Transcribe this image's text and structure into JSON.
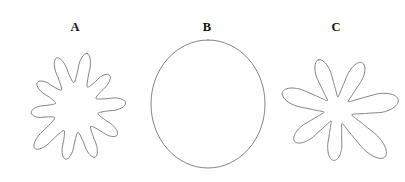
{
  "figure": {
    "background_color": "#ffffff",
    "width": 405,
    "height": 182,
    "stroke_color": "#6e6e72",
    "label_color": "#101010",
    "caption": ""
  },
  "panels": [
    {
      "label": "A",
      "label_x": 75,
      "label_y": 31,
      "shape_name": "lobed-blob-many-lobes",
      "description": "irregular closed outline with ten rounded finger-like lobes radiating from a central body",
      "center_x": 76,
      "center_y": 108,
      "lobe_count": 10,
      "mean_radius": 38,
      "lobe_amplitude": 14,
      "bounds": {
        "x": 22,
        "y": 45,
        "width": 108,
        "height": 125
      }
    },
    {
      "label": "B",
      "label_x": 207,
      "label_y": 31,
      "shape_name": "smooth-ellipse",
      "description": "smooth convex closed outline, near-circular ellipse with no lobes",
      "center_x": 208,
      "center_y": 104,
      "lobe_count": 0,
      "radius_x": 57,
      "radius_y": 64,
      "bounds": {
        "x": 151,
        "y": 40,
        "width": 114,
        "height": 128
      }
    },
    {
      "label": "C",
      "label_x": 336,
      "label_y": 31,
      "shape_name": "lobed-blob-few-long-lobes",
      "description": "irregular closed outline with seven long narrow finger-like lobes of uneven length",
      "center_x": 337,
      "center_y": 110,
      "lobe_count": 7,
      "mean_radius": 36,
      "lobe_amplitude": 22,
      "bounds": {
        "x": 283,
        "y": 44,
        "width": 110,
        "height": 130
      }
    }
  ]
}
